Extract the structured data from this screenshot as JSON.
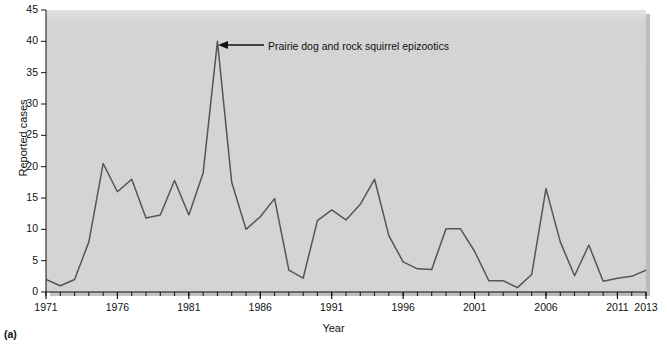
{
  "figure": {
    "panel_label": "(a)",
    "annotation": "Prairie dog and rock squirrel epizootics",
    "line_color": "#555555",
    "plot_background": "#d4d4d4",
    "page_background": "#ffffff"
  },
  "chart_data": {
    "type": "line",
    "title": "",
    "xlabel": "Year",
    "ylabel": "Reported cases",
    "xlim": [
      1971,
      2013
    ],
    "ylim": [
      0,
      45
    ],
    "ytick_labels": [
      "0",
      "5",
      "10",
      "15",
      "20",
      "25",
      "30",
      "35",
      "40",
      "45"
    ],
    "yticks": [
      0,
      5,
      10,
      15,
      20,
      25,
      30,
      35,
      40,
      45
    ],
    "xtick_labels": [
      "1971",
      "1976",
      "1981",
      "1986",
      "1991",
      "1996",
      "2001",
      "2006",
      "2011",
      "2013"
    ],
    "xticks": [
      1971,
      1976,
      1981,
      1986,
      1991,
      1996,
      2001,
      2006,
      2011,
      2013
    ],
    "minor_xticks_every": 1,
    "grid": false,
    "legend": null,
    "x": [
      1971,
      1972,
      1973,
      1974,
      1975,
      1976,
      1977,
      1978,
      1979,
      1980,
      1981,
      1982,
      1983,
      1984,
      1985,
      1986,
      1987,
      1988,
      1989,
      1990,
      1991,
      1992,
      1993,
      1994,
      1995,
      1996,
      1997,
      1998,
      1999,
      2000,
      2001,
      2002,
      2003,
      2004,
      2005,
      2006,
      2007,
      2008,
      2009,
      2010,
      2011,
      2012,
      2013
    ],
    "values": [
      2,
      1,
      2,
      8,
      20.5,
      16,
      18,
      11.8,
      12.3,
      17.8,
      12.3,
      19,
      40,
      17.5,
      10,
      12,
      14.9,
      3.5,
      2.2,
      11.4,
      13.1,
      11.5,
      14,
      18,
      9,
      4.8,
      3.7,
      3.6,
      10.1,
      10.1,
      6.5,
      1.8,
      1.8,
      0.7,
      2.8,
      16.5,
      8,
      2.6,
      7.5,
      1.7,
      2.2,
      2.5,
      3.5
    ],
    "annotations": [
      {
        "text": "Prairie dog and rock squirrel epizootics",
        "x": 1983,
        "y": 40
      }
    ]
  }
}
